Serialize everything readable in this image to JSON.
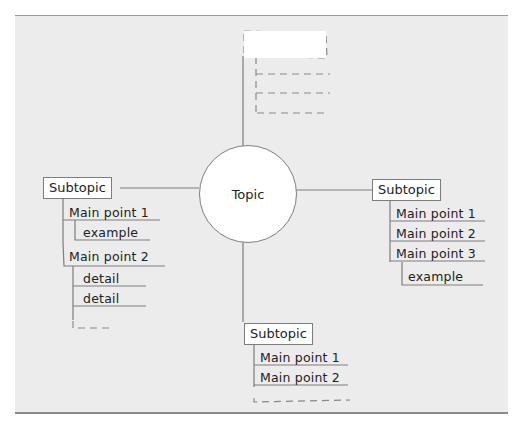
{
  "diagram": {
    "type": "mind-map",
    "center_topic": "Topic",
    "placeholder_branch": {
      "position": "top",
      "title": "",
      "empty_items": 3
    },
    "branches": [
      {
        "position": "left",
        "subtopic": "Subtopic",
        "main_points": [
          {
            "label": "Main point 1",
            "children": [
              "example"
            ]
          },
          {
            "label": "Main point 2",
            "children": [
              "detail",
              "detail"
            ]
          }
        ],
        "trailing_placeholder": true
      },
      {
        "position": "right",
        "subtopic": "Subtopic",
        "main_points": [
          {
            "label": "Main point 1",
            "children": []
          },
          {
            "label": "Main point 2",
            "children": []
          },
          {
            "label": "Main point 3",
            "children": [
              "example"
            ]
          }
        ],
        "trailing_placeholder": false
      },
      {
        "position": "bottom",
        "subtopic": "Subtopic",
        "main_points": [
          {
            "label": "Main point 1",
            "children": []
          },
          {
            "label": "Main point 2",
            "children": []
          }
        ],
        "trailing_placeholder": true
      }
    ]
  },
  "colors": {
    "background": "#ececec",
    "line": "#7d7d7d",
    "dashed": "#8a8a8a",
    "node_fill": "#ffffff",
    "text": "#222222"
  }
}
